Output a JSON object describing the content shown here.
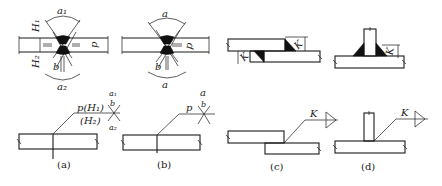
{
  "figure": {
    "panels": [
      {
        "id": "a",
        "caption": "(a)",
        "joint": "double-V butt joint (unequal)",
        "labels": {
          "angle_top": "a₁",
          "angle_bottom": "a₂",
          "depth_top": "H₁",
          "depth_bottom": "H₂",
          "root_face": "p",
          "gap": "b"
        },
        "symbol": {
          "above": "p(H₁)",
          "below": "(H₂)",
          "angle_top": "a₁",
          "angle_bottom": "a₂",
          "gap": "b"
        }
      },
      {
        "id": "b",
        "caption": "(b)",
        "joint": "double-V butt joint (symmetric)",
        "labels": {
          "angle_top": "a",
          "angle_bottom": "a",
          "root_face": "p",
          "gap": "b"
        },
        "symbol": {
          "above": "p",
          "angle_top": "a",
          "gap": "b"
        }
      },
      {
        "id": "c",
        "caption": "(c)",
        "joint": "lap joint, double fillet",
        "labels": {
          "leg_top": "K",
          "leg_bottom": "K"
        },
        "symbol": {
          "above": "K"
        }
      },
      {
        "id": "d",
        "caption": "(d)",
        "joint": "T-joint, double fillet",
        "labels": {
          "leg": "K"
        },
        "symbol": {
          "above": "K"
        }
      }
    ]
  }
}
